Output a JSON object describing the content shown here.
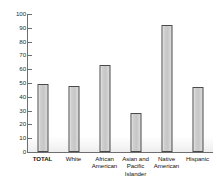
{
  "chart_data": {
    "type": "bar",
    "title": "",
    "subtitle": "",
    "xlabel": "",
    "ylabel": "",
    "categories": [
      "TOTAL",
      "White",
      "African American",
      "Asian and Pacific Islander",
      "Native American",
      "Hispanic"
    ],
    "category_lines": [
      [
        "TOTAL"
      ],
      [
        "White"
      ],
      [
        "African",
        "American"
      ],
      [
        "Asian and",
        "Pacific",
        "Islander"
      ],
      [
        "Native",
        "American"
      ],
      [
        "Hispanic"
      ]
    ],
    "values": [
      49,
      48,
      63,
      28,
      92,
      47
    ],
    "ylim": [
      0,
      100
    ],
    "ytick_step": 10,
    "ytick_labels": [
      "0",
      "10",
      "20",
      "30",
      "40",
      "50",
      "60",
      "70",
      "80",
      "90",
      "100"
    ],
    "grid": false,
    "legend": false,
    "bar_fill_color": "#cfcfcf",
    "bar_border_color": "#4a4a4a",
    "axis_color": "#6e6e6e",
    "background_color": "#ffffff"
  }
}
